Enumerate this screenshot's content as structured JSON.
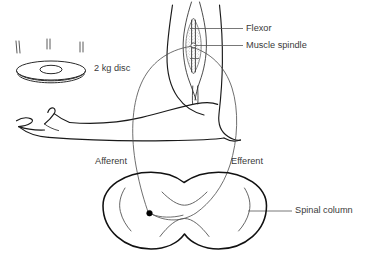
{
  "diagram": {
    "background_color": "#ffffff",
    "line_color": "#1a1a1a",
    "label_color": "#3a3a3a",
    "width": 369,
    "height": 270
  },
  "labels": {
    "disc": "2 kg disc",
    "flexor": "Flexor",
    "muscle_spindle": "Muscle spindle",
    "afferent": "Afferent",
    "efferent": "Efferent",
    "spinal_column": "Spinal column"
  },
  "parts": [
    {
      "id": "disc",
      "name": "2 kg disc",
      "icon": "disc-icon"
    },
    {
      "id": "hand",
      "name": "Open hand",
      "icon": "hand-icon"
    },
    {
      "id": "forearm",
      "name": "Forearm",
      "icon": "forearm-icon"
    },
    {
      "id": "upper-arm",
      "name": "Upper arm",
      "icon": "upper-arm-icon"
    },
    {
      "id": "flexor",
      "name": "Flexor",
      "icon": "flexor-muscle-icon"
    },
    {
      "id": "muscle-spindle",
      "name": "Muscle spindle",
      "icon": "muscle-spindle-icon"
    },
    {
      "id": "afferent-nerve",
      "name": "Afferent",
      "icon": "afferent-nerve-icon"
    },
    {
      "id": "efferent-nerve",
      "name": "Efferent",
      "icon": "efferent-nerve-icon"
    },
    {
      "id": "synapse",
      "name": "Synapse",
      "icon": "synapse-dot-icon"
    },
    {
      "id": "spinal-column",
      "name": "Spinal column",
      "icon": "spinal-cord-icon"
    }
  ]
}
